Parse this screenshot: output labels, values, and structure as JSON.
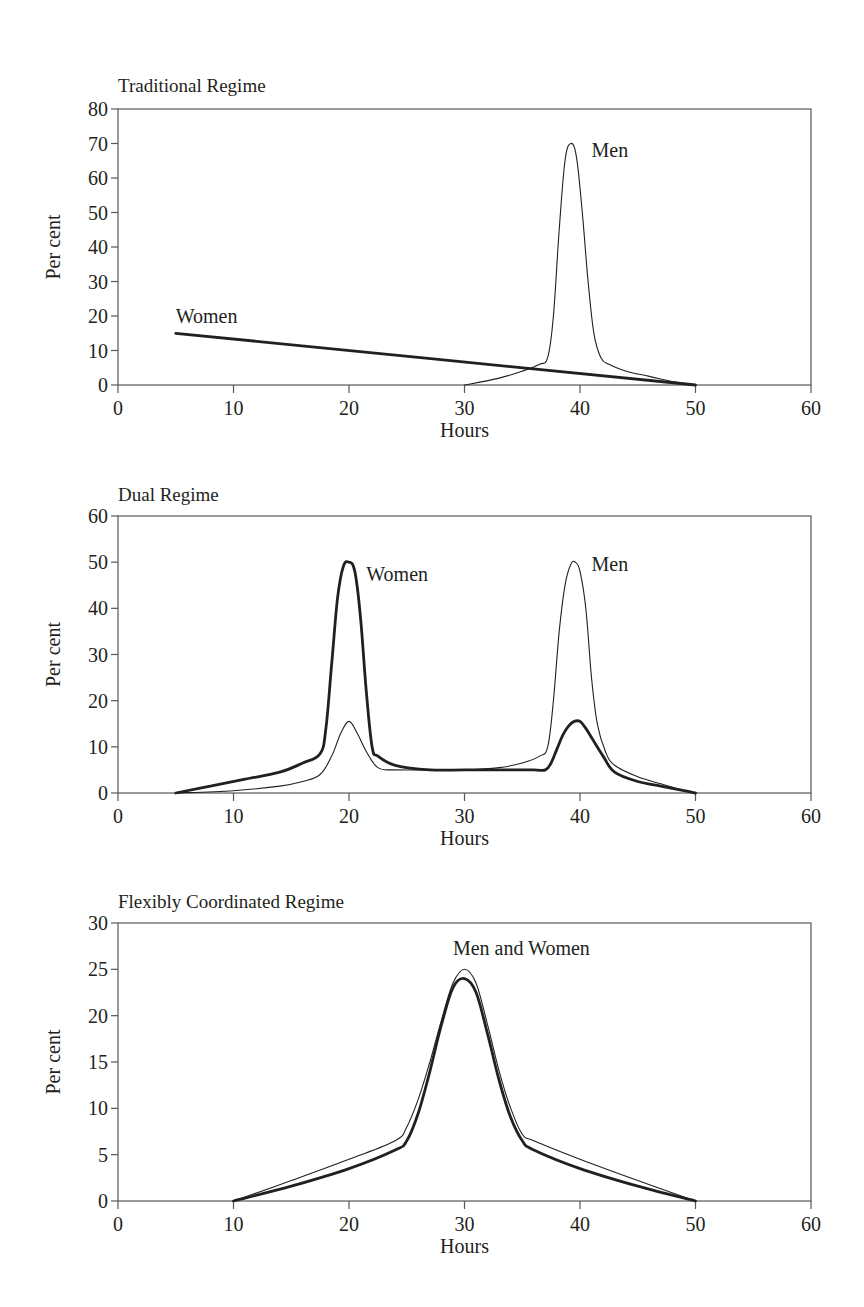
{
  "figure": {
    "panels": [
      {
        "title": "Traditional Regime",
        "xlabel": "Hours",
        "ylabel": "Per cent"
      },
      {
        "title": "Dual Regime",
        "xlabel": "Hours",
        "ylabel": "Per cent"
      },
      {
        "title": "Flexibly Coordinated Regime",
        "xlabel": "Hours",
        "ylabel": "Per cent"
      }
    ]
  },
  "chart_data": [
    {
      "type": "line",
      "title": "Traditional Regime",
      "xlabel": "Hours",
      "ylabel": "Per cent",
      "xlim": [
        0,
        60
      ],
      "ylim": [
        0,
        80
      ],
      "xticks": [
        0,
        10,
        20,
        30,
        40,
        50,
        60
      ],
      "yticks": [
        0,
        10,
        20,
        30,
        40,
        50,
        60,
        70,
        80
      ],
      "grid": false,
      "legend": "inline labels",
      "annotations": [
        {
          "text": "Men",
          "x": 41,
          "y": 66
        },
        {
          "text": "Women",
          "x": 5,
          "y": 18
        }
      ],
      "series": [
        {
          "name": "Men",
          "style": "thin",
          "x": [
            30,
            33,
            35,
            36.5,
            37.2,
            37.7,
            38.2,
            38.7,
            39.2,
            39.7,
            40.2,
            40.7,
            41.2,
            41.8,
            42.5,
            44,
            46,
            48,
            50
          ],
          "y": [
            0,
            2,
            4,
            6,
            8,
            20,
            45,
            65,
            70,
            66,
            50,
            30,
            15,
            8,
            6,
            4,
            2.5,
            1,
            0
          ]
        },
        {
          "name": "Women",
          "style": "thick",
          "x": [
            5,
            50
          ],
          "y": [
            15,
            0
          ]
        }
      ]
    },
    {
      "type": "line",
      "title": "Dual Regime",
      "xlabel": "Hours",
      "ylabel": "Per cent",
      "xlim": [
        0,
        60
      ],
      "ylim": [
        0,
        60
      ],
      "xticks": [
        0,
        10,
        20,
        30,
        40,
        50,
        60
      ],
      "yticks": [
        0,
        10,
        20,
        30,
        40,
        50,
        60
      ],
      "grid": false,
      "legend": "inline labels",
      "annotations": [
        {
          "text": "Women",
          "x": 21.5,
          "y": 46
        },
        {
          "text": "Men",
          "x": 41,
          "y": 48
        }
      ],
      "series": [
        {
          "name": "Women",
          "style": "thick",
          "x": [
            5,
            8,
            11,
            14,
            16,
            17.5,
            18,
            18.5,
            19,
            19.5,
            20,
            20.5,
            21,
            21.5,
            22,
            22.5,
            24,
            27,
            30,
            33,
            36,
            37,
            37.5,
            38,
            38.5,
            39,
            39.5,
            40,
            40.5,
            41,
            42,
            43,
            45,
            47,
            49,
            50
          ],
          "y": [
            0,
            1.5,
            3,
            4.5,
            6.5,
            8.5,
            14,
            28,
            42,
            49,
            50,
            48,
            38,
            22,
            10,
            8,
            6,
            5,
            5,
            5,
            5,
            5,
            6.5,
            9.5,
            12.5,
            14.5,
            15.5,
            15.5,
            14,
            12,
            8,
            4.5,
            2.5,
            1.5,
            0.5,
            0
          ]
        },
        {
          "name": "Men",
          "style": "thin",
          "x": [
            5,
            10,
            14,
            16,
            17.5,
            18.5,
            19.3,
            20,
            20.7,
            21.5,
            22.5,
            24,
            27,
            30,
            33,
            35,
            36.5,
            37.2,
            37.7,
            38.2,
            38.7,
            39.2,
            39.6,
            40,
            40.5,
            41,
            41.5,
            42.2,
            43,
            45,
            47,
            49,
            50
          ],
          "y": [
            0,
            0.5,
            1.5,
            2.5,
            4,
            8,
            13,
            15.5,
            13,
            9,
            5.5,
            5,
            5,
            5,
            5.5,
            6.5,
            8,
            10,
            20,
            35,
            45,
            49.5,
            50,
            48,
            40,
            25,
            15,
            9,
            6,
            3.5,
            2,
            0.5,
            0
          ]
        }
      ]
    },
    {
      "type": "line",
      "title": "Flexibly Coordinated Regime",
      "xlabel": "Hours",
      "ylabel": "Per cent",
      "xlim": [
        0,
        60
      ],
      "ylim": [
        0,
        30
      ],
      "xticks": [
        0,
        10,
        20,
        30,
        40,
        50,
        60
      ],
      "yticks": [
        0,
        5,
        10,
        15,
        20,
        25,
        30
      ],
      "grid": false,
      "legend": "inline labels",
      "annotations": [
        {
          "text": "Men and Women",
          "x": 29,
          "y": 26.5
        }
      ],
      "series": [
        {
          "name": "Men",
          "style": "thin",
          "x": [
            10,
            15,
            20,
            24,
            25,
            26,
            27,
            28,
            29,
            30,
            31,
            32,
            33,
            34,
            35,
            36,
            40,
            45,
            50
          ],
          "y": [
            0,
            2.2,
            4.5,
            6.5,
            8,
            11,
            15,
            19.5,
            23.5,
            25,
            23.5,
            19,
            14,
            10,
            7.2,
            6.5,
            4.5,
            2.2,
            0
          ]
        },
        {
          "name": "Women",
          "style": "thick",
          "x": [
            10,
            15,
            20,
            24,
            25,
            26,
            27,
            28,
            29,
            30,
            31,
            32,
            33,
            34,
            35,
            36,
            40,
            45,
            50
          ],
          "y": [
            0,
            1.6,
            3.5,
            5.5,
            6.5,
            9.5,
            14,
            19,
            23,
            24,
            22.5,
            18,
            13,
            9,
            6.5,
            5.5,
            3.5,
            1.6,
            0
          ]
        }
      ]
    }
  ]
}
